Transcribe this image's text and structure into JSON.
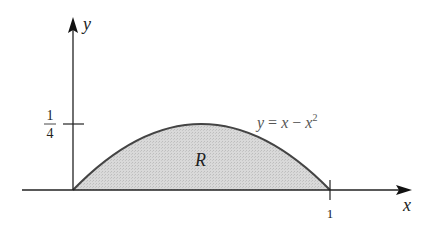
{
  "figure": {
    "type": "region-under-curve",
    "equation_label": "y = x − x²",
    "equation_parts": {
      "lhs": "y",
      "eq": " = ",
      "x1": "x",
      "minus": " − ",
      "x2": "x",
      "exp": "2"
    },
    "region_label": "R",
    "axes": {
      "x_label": "x",
      "y_label": "y",
      "x_ticks": [
        {
          "value": 1,
          "label": "1"
        }
      ],
      "y_ticks": [
        {
          "value": 0.25,
          "label_num": "1",
          "label_den": "4"
        }
      ]
    },
    "colors": {
      "axis": "#222222",
      "curve": "#444444",
      "fill": "#d4d4d4"
    }
  }
}
